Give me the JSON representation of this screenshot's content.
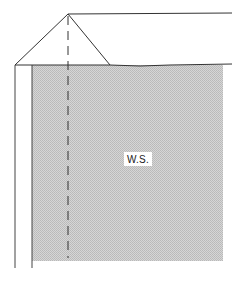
{
  "diagram": {
    "region_label": "W.S.",
    "colors": {
      "line": "#333333",
      "hatch_fill": "#cfcfcf",
      "hatch_dot": "#b5b5b5",
      "background": "#ffffff"
    }
  }
}
